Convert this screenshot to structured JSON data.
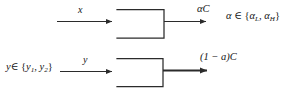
{
  "figure": {
    "type": "block-flow-diagram",
    "background_color": "#ffffff",
    "line_color": "#2b2b2b",
    "text_color": "#141414"
  },
  "labels": {
    "input_top": "x",
    "input_bottom": "y",
    "input_bottom_domain_lead": "y",
    "input_bottom_domain_member": "∈ {",
    "input_bottom_domain_y1": "y",
    "input_bottom_domain_y1_sub": "1",
    "input_bottom_domain_sep": ", ",
    "input_bottom_domain_y2": "y",
    "input_bottom_domain_y2_sub": "2",
    "input_bottom_domain_close": "}",
    "output_top_alpha": "α",
    "output_top_c": "C",
    "output_bottom": "(1 − a)C",
    "alpha_domain_lead": "α",
    "alpha_domain_member": " ∈ {",
    "alpha_domain_l": "α",
    "alpha_domain_l_sub": "L",
    "alpha_domain_sep": ", ",
    "alpha_domain_h": "α",
    "alpha_domain_h_sub": "H",
    "alpha_domain_close": "}"
  },
  "blocks": [
    {
      "id": "block-top",
      "shape": "open-left-rectangle",
      "x": 117,
      "y": 9,
      "width": 47,
      "height": 29,
      "label": ""
    },
    {
      "id": "block-bottom",
      "shape": "open-left-rectangle",
      "x": 117,
      "y": 58,
      "width": 46,
      "height": 29,
      "label": ""
    }
  ],
  "arrows": [
    {
      "id": "arrow-input-top",
      "x1": 57,
      "y1": 21,
      "x2": 117,
      "y2": 21,
      "weight": "thin"
    },
    {
      "id": "arrow-input-bottom",
      "x1": 60,
      "y1": 71,
      "x2": 117,
      "y2": 71,
      "weight": "thin"
    },
    {
      "id": "arrow-output-top",
      "x1": 164,
      "y1": 21,
      "x2": 211,
      "y2": 21,
      "weight": "thin"
    },
    {
      "id": "arrow-output-bottom",
      "x1": 163,
      "y1": 70,
      "x2": 213,
      "y2": 70,
      "weight": "thick"
    }
  ]
}
